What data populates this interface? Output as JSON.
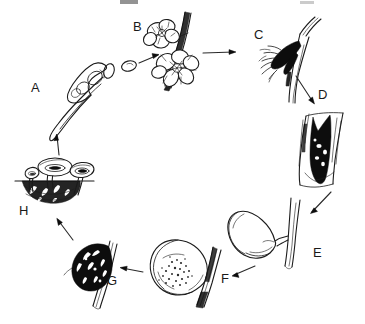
{
  "diagram": {
    "layout": "clockwise circular cycle",
    "background_color": "#ffffff",
    "ink_color": "#1b1b1b",
    "stage_count": 8,
    "stages": [
      {
        "id": "A",
        "label": "A",
        "label_x": 31,
        "label_y": 81,
        "name": "germinating-ascospore",
        "description": "Elongated germinating spore with germ tube and cells"
      },
      {
        "id": "B",
        "label": "B",
        "label_x": 133,
        "label_y": 20,
        "name": "infected-blossoms",
        "description": "Open blossoms on a twig being infected by airborne spores"
      },
      {
        "id": "C",
        "label": "C",
        "label_x": 254,
        "label_y": 28,
        "name": "blighted-blossom",
        "description": "Blighted, collapsed blossom cluster attached to the twig"
      },
      {
        "id": "D",
        "label": "D",
        "label_x": 318,
        "label_y": 88,
        "name": "twig-canker",
        "description": "Dark sunken canker on the twig with gum exudate"
      },
      {
        "id": "E",
        "label": "E",
        "label_x": 313,
        "label_y": 246,
        "name": "young-fruit",
        "description": "Healthy young green fruit attached to a twig"
      },
      {
        "id": "F",
        "label": "F",
        "label_x": 221,
        "label_y": 272,
        "name": "rotting-fruit",
        "description": "Ripening fruit with brown rot lesion and spore tufts"
      },
      {
        "id": "G",
        "label": "G",
        "label_x": 107,
        "label_y": 274,
        "name": "mummified-fruit",
        "description": "Shriveled blackened mummy fruit overwintering on the twig"
      },
      {
        "id": "H",
        "label": "H",
        "label_x": 19,
        "label_y": 204,
        "name": "apothecia-on-ground",
        "description": "Cup-shaped apothecia arising from a buried mummy at the soil line"
      }
    ],
    "arrows": [
      {
        "name": "arrow-a-to-b",
        "from": "A",
        "to": "B"
      },
      {
        "name": "arrow-b-to-c",
        "from": "B",
        "to": "C"
      },
      {
        "name": "arrow-c-to-d",
        "from": "C",
        "to": "D"
      },
      {
        "name": "arrow-d-to-e",
        "from": "D",
        "to": "E"
      },
      {
        "name": "arrow-e-to-f",
        "from": "E",
        "to": "F"
      },
      {
        "name": "arrow-f-to-g",
        "from": "F",
        "to": "G"
      },
      {
        "name": "arrow-g-to-h",
        "from": "G",
        "to": "H"
      },
      {
        "name": "arrow-h-to-a",
        "from": "H",
        "to": "A"
      }
    ]
  }
}
